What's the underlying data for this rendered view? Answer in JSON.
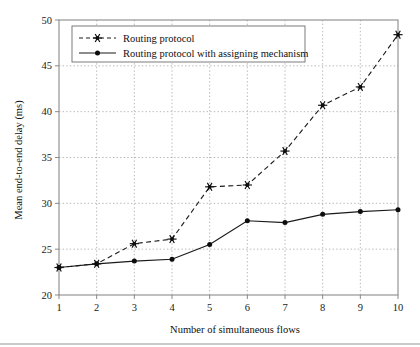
{
  "chart_data": {
    "type": "line",
    "title": "",
    "xlabel": "Number of simultaneous flows",
    "ylabel": "Mean end-to-end delay (ms)",
    "x": [
      1,
      2,
      3,
      4,
      5,
      6,
      7,
      8,
      9,
      10
    ],
    "xlim": [
      1,
      10
    ],
    "ylim": [
      20,
      50
    ],
    "xticks": [
      "1",
      "2",
      "3",
      "4",
      "5",
      "6",
      "7",
      "8",
      "9",
      "10"
    ],
    "yticks": [
      "20",
      "25",
      "30",
      "35",
      "40",
      "45",
      "50"
    ],
    "grid": true,
    "legend_position": "top-left",
    "series": [
      {
        "name": "Routing protocol",
        "marker": "star",
        "linestyle": "dashed",
        "color": "#1a1a1a",
        "values": [
          23.0,
          23.4,
          25.6,
          26.1,
          31.8,
          32.0,
          35.7,
          40.7,
          42.7,
          48.4
        ]
      },
      {
        "name": "Routing protocol with assigning mechanism",
        "marker": "circle",
        "linestyle": "solid",
        "color": "#1a1a1a",
        "values": [
          23.0,
          23.4,
          23.7,
          23.9,
          25.5,
          28.1,
          27.9,
          28.8,
          29.1,
          29.3
        ]
      }
    ]
  },
  "legend": {
    "entries": [
      {
        "label": "Routing protocol"
      },
      {
        "label": "Routing protocol with assigning mechanism"
      }
    ]
  },
  "colors": {
    "ink": "#1a1a1a",
    "axis": "#8a8a8a",
    "grid": "#9a9a9a",
    "background": "#ffffff"
  }
}
